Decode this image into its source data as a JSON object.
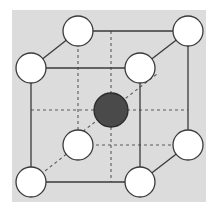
{
  "figure": {
    "canvas": {
      "width": 218,
      "height": 216
    },
    "panel": {
      "name": "figure-panel",
      "x": 12,
      "y": 10,
      "width": 194,
      "height": 192,
      "fill": "#dcdcdc"
    },
    "colors": {
      "page_background": "#ffffff",
      "panel_background": "#dcdcdc",
      "edge_stroke": "#3a3a3a",
      "hidden_edge_stroke": "#5a5a5a",
      "corner_atom_fill": "#ffffff",
      "corner_atom_stroke": "#3a3a3a",
      "center_atom_fill": "#4a4a4a",
      "center_atom_stroke": "#2b2b2b"
    },
    "geometry": {
      "corner_radius": 15,
      "center_radius": 17,
      "edge_width": 1.3,
      "hidden_edge_width": 1.1,
      "hidden_dash": "3,3"
    },
    "vertices": [
      {
        "id": "front-top-left",
        "label": "corner atom",
        "x": 31,
        "y": 68,
        "hidden": false
      },
      {
        "id": "front-top-right",
        "label": "corner atom",
        "x": 140,
        "y": 68,
        "hidden": false
      },
      {
        "id": "front-bottom-right",
        "label": "corner atom",
        "x": 140,
        "y": 182,
        "hidden": false
      },
      {
        "id": "front-bottom-left",
        "label": "corner atom",
        "x": 31,
        "y": 182,
        "hidden": false
      },
      {
        "id": "back-top-left",
        "label": "corner atom",
        "x": 78,
        "y": 31,
        "hidden": false
      },
      {
        "id": "back-top-right",
        "label": "corner atom",
        "x": 188,
        "y": 31,
        "hidden": false
      },
      {
        "id": "back-bottom-right",
        "label": "corner atom",
        "x": 188,
        "y": 145,
        "hidden": false
      },
      {
        "id": "back-bottom-left",
        "label": "corner atom",
        "x": 78,
        "y": 145,
        "hidden": true
      }
    ],
    "center_atom": {
      "id": "body-centre",
      "label": "body centre atom",
      "x": 111,
      "y": 110,
      "r": 17
    },
    "solid_edges": [
      {
        "id": "front-top",
        "x1": 31,
        "y1": 68,
        "x2": 140,
        "y2": 68
      },
      {
        "id": "front-right",
        "x1": 140,
        "y1": 68,
        "x2": 140,
        "y2": 182
      },
      {
        "id": "front-bottom",
        "x1": 140,
        "y1": 182,
        "x2": 31,
        "y2": 182
      },
      {
        "id": "front-left",
        "x1": 31,
        "y1": 182,
        "x2": 31,
        "y2": 68
      },
      {
        "id": "back-top",
        "x1": 78,
        "y1": 31,
        "x2": 188,
        "y2": 31
      },
      {
        "id": "back-right",
        "x1": 188,
        "y1": 31,
        "x2": 188,
        "y2": 145
      },
      {
        "id": "connector-top-left",
        "x1": 31,
        "y1": 68,
        "x2": 78,
        "y2": 31
      },
      {
        "id": "connector-top-right",
        "x1": 140,
        "y1": 68,
        "x2": 188,
        "y2": 31
      },
      {
        "id": "connector-bottom-right",
        "x1": 140,
        "y1": 182,
        "x2": 188,
        "y2": 145
      }
    ],
    "hidden_edges": [
      {
        "id": "back-left-hidden",
        "x1": 78,
        "y1": 31,
        "x2": 78,
        "y2": 145
      },
      {
        "id": "back-bottom-hidden",
        "x1": 78,
        "y1": 145,
        "x2": 188,
        "y2": 145
      },
      {
        "id": "connector-bottom-left-hidden",
        "x1": 31,
        "y1": 182,
        "x2": 78,
        "y2": 145
      }
    ],
    "diagonals": [
      {
        "id": "diagonal-horizontal",
        "x1": 31,
        "y1": 110,
        "x2": 188,
        "y2": 110
      },
      {
        "id": "diagonal-vertical",
        "x1": 111,
        "y1": 31,
        "x2": 111,
        "y2": 182
      },
      {
        "id": "diagonal-depth",
        "x1": 64,
        "y1": 146,
        "x2": 157,
        "y2": 74
      }
    ]
  }
}
